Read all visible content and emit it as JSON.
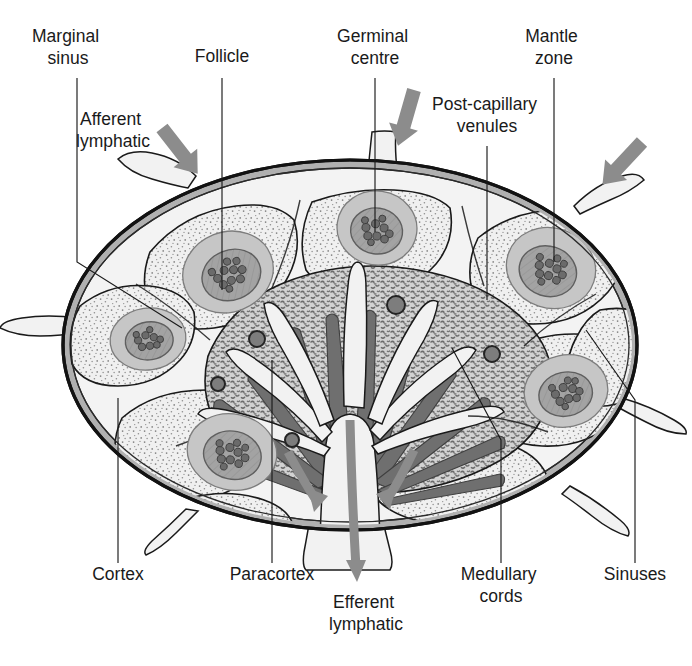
{
  "figure": {
    "background_color": "#ffffff",
    "width": 692,
    "height": 666
  },
  "palette": {
    "capsule_outer": "#161616",
    "capsule_band": "#a8a8a8",
    "sinus_fill": "#f2f2f2",
    "cortex_fill": "#efefef",
    "cortex_stipple": "#7a7a7a",
    "paracortex_fill": "#c9c9c9",
    "paracortex_stipple": "#6e6e6e",
    "mantle_fill": "#c4c4c4",
    "germinal_fill": "#9d9d9d",
    "germinal_dot": "#6b6b6b",
    "medullary_cord": "#6f6f6f",
    "venule_fill": "#7d7d7d",
    "arrow_gray": "#8c8c8c",
    "line": "#1a1a1a",
    "text": "#1a1a1a"
  },
  "labels": [
    {
      "id": "marginal-sinus",
      "lines": [
        "Marginal",
        "sinus"
      ],
      "x": 68,
      "y": 42,
      "align": "middle"
    },
    {
      "id": "follicle",
      "lines": [
        "Follicle"
      ],
      "x": 222,
      "y": 62,
      "align": "middle"
    },
    {
      "id": "germinal-centre",
      "lines": [
        "Germinal",
        "centre"
      ],
      "x": 375,
      "y": 42,
      "align": "middle"
    },
    {
      "id": "mantle-zone",
      "lines": [
        "Mantle",
        "zone"
      ],
      "x": 554,
      "y": 42,
      "align": "middle"
    },
    {
      "id": "afferent-lymphatic",
      "lines": [
        "Afferent",
        "lymphatic"
      ],
      "x": 113,
      "y": 125,
      "align": "middle"
    },
    {
      "id": "post-capillary-venules",
      "lines": [
        "Post-capillary",
        "venules"
      ],
      "x": 487,
      "y": 110,
      "align": "middle"
    },
    {
      "id": "cortex",
      "lines": [
        "Cortex"
      ],
      "x": 118,
      "y": 580,
      "align": "middle"
    },
    {
      "id": "paracortex",
      "lines": [
        "Paracortex"
      ],
      "x": 272,
      "y": 580,
      "align": "middle"
    },
    {
      "id": "efferent-lymphatic",
      "lines": [
        "Efferent",
        "lymphatic"
      ],
      "x": 366,
      "y": 608,
      "align": "middle"
    },
    {
      "id": "medullary-cords",
      "lines": [
        "Medullary",
        "cords"
      ],
      "x": 501,
      "y": 580,
      "align": "middle"
    },
    {
      "id": "sinuses",
      "lines": [
        "Sinuses"
      ],
      "x": 635,
      "y": 580,
      "align": "middle"
    }
  ],
  "leaders": [
    {
      "id": "leader-marginal-sinus",
      "points": "77,78 77,262 182,328"
    },
    {
      "id": "leader-follicle",
      "points": "222,78 222,290"
    },
    {
      "id": "leader-germinal-centre",
      "points": "375,78 375,232"
    },
    {
      "id": "leader-mantle-zone",
      "points": "554,78 554,262"
    },
    {
      "id": "leader-post-capillary",
      "points": "487,146 487,300"
    },
    {
      "id": "leader-cortex",
      "points": "118,563 118,398"
    },
    {
      "id": "leader-paracortex",
      "points": "272,563 272,360"
    },
    {
      "id": "leader-medullary-cords",
      "points": "501,563 501,440 452,348"
    },
    {
      "id": "leader-sinuses",
      "points": "635,563 635,400 586,330"
    }
  ],
  "arrows": [
    {
      "id": "afferent-arrow-left",
      "kind": "afferent",
      "x1": 162,
      "y1": 128,
      "x2": 196,
      "y2": 172
    },
    {
      "id": "afferent-arrow-top",
      "kind": "afferent",
      "x1": 417,
      "y1": 92,
      "x2": 401,
      "y2": 148
    },
    {
      "id": "afferent-arrow-right",
      "kind": "afferent",
      "x1": 636,
      "y1": 148,
      "x2": 597,
      "y2": 190
    },
    {
      "id": "efferent-arrow-left",
      "kind": "efferent"
    },
    {
      "id": "efferent-arrow-right",
      "kind": "efferent"
    },
    {
      "id": "efferent-arrow-main",
      "kind": "efferent"
    }
  ],
  "node": {
    "centre_x": 350,
    "centre_y": 345,
    "radius_x": 287,
    "radius_y": 185,
    "capsule_thickness": 9
  },
  "follicles": [
    {
      "id": "follicle-upper-left",
      "cx": 228,
      "cy": 272,
      "rx": 46,
      "ry": 40,
      "rot": -22,
      "gc_rx": 30,
      "gc_ry": 25,
      "dots": 11
    },
    {
      "id": "follicle-top-centre",
      "cx": 377,
      "cy": 228,
      "rx": 40,
      "ry": 37,
      "rot": 8,
      "gc_rx": 26,
      "gc_ry": 23,
      "dots": 10
    },
    {
      "id": "follicle-upper-right",
      "cx": 551,
      "cy": 268,
      "rx": 45,
      "ry": 40,
      "rot": 18,
      "gc_rx": 29,
      "gc_ry": 25,
      "dots": 11
    },
    {
      "id": "follicle-left",
      "cx": 148,
      "cy": 339,
      "rx": 38,
      "ry": 31,
      "rot": -8,
      "gc_rx": 24,
      "gc_ry": 19,
      "dots": 9
    },
    {
      "id": "follicle-lower-left",
      "cx": 232,
      "cy": 452,
      "rx": 45,
      "ry": 38,
      "rot": 12,
      "gc_rx": 29,
      "gc_ry": 24,
      "dots": 11
    },
    {
      "id": "follicle-lower-right",
      "cx": 566,
      "cy": 391,
      "rx": 42,
      "ry": 36,
      "rot": -12,
      "gc_rx": 27,
      "gc_ry": 22,
      "dots": 11
    }
  ],
  "venules": [
    {
      "id": "venule-1",
      "cx": 396,
      "cy": 305,
      "r": 9
    },
    {
      "id": "venule-2",
      "cx": 257,
      "cy": 339,
      "r": 8
    },
    {
      "id": "venule-3",
      "cx": 218,
      "cy": 384,
      "r": 7
    },
    {
      "id": "venule-4",
      "cx": 492,
      "cy": 354,
      "r": 8
    },
    {
      "id": "venule-5",
      "cx": 292,
      "cy": 440,
      "r": 7
    }
  ],
  "structures": {
    "capsule": "capsule",
    "marginal_sinus": "marginal-sinus",
    "cortex": "cortex",
    "paracortex": "paracortex",
    "medulla": "medulla",
    "medullary_cords": "medullary-cords",
    "hilum": "hilum"
  }
}
